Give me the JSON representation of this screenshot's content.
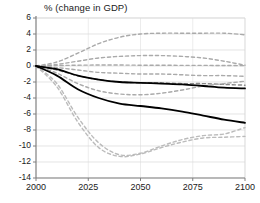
{
  "chart_data": {
    "type": "line",
    "title": "% (change in GDP)",
    "xlabel": "",
    "ylabel": "% (change in GDP)",
    "xlim": [
      2000,
      2100
    ],
    "ylim": [
      -14,
      6
    ],
    "grid": true,
    "legend": "none",
    "xticks": [
      2000,
      2025,
      2050,
      2075,
      2100
    ],
    "yticks": [
      6,
      4,
      2,
      0,
      -2,
      -4,
      -6,
      -8,
      -10,
      -12,
      -14
    ],
    "x": [
      2000,
      2010,
      2020,
      2030,
      2040,
      2050,
      2060,
      2070,
      2080,
      2090,
      2100
    ],
    "series": [
      {
        "name": "central-estimate-upper",
        "style": "solid",
        "color": "#000000",
        "width": 1.8,
        "values": [
          0.0,
          -0.4,
          -1.2,
          -1.7,
          -2.0,
          -2.1,
          -2.2,
          -2.3,
          -2.5,
          -2.7,
          -2.8
        ]
      },
      {
        "name": "central-estimate-lower",
        "style": "solid",
        "color": "#000000",
        "width": 1.8,
        "values": [
          0.0,
          -1.2,
          -2.9,
          -4.0,
          -4.7,
          -5.0,
          -5.3,
          -5.7,
          -6.2,
          -6.7,
          -7.1
        ]
      },
      {
        "name": "scenario-band-1",
        "style": "dashed",
        "color": "#aaaaaa",
        "width": 1.4,
        "values": [
          0.0,
          0.5,
          1.6,
          2.8,
          3.6,
          4.0,
          4.1,
          4.1,
          4.1,
          4.1,
          3.9
        ]
      },
      {
        "name": "scenario-band-2",
        "style": "dashed",
        "color": "#aaaaaa",
        "width": 1.4,
        "values": [
          0.0,
          0.2,
          0.6,
          1.0,
          1.2,
          1.3,
          1.3,
          1.2,
          1.0,
          0.6,
          0.1
        ]
      },
      {
        "name": "scenario-band-3",
        "style": "dashed",
        "color": "#aaaaaa",
        "width": 1.4,
        "values": [
          0.0,
          0.05,
          0.1,
          0.12,
          0.12,
          0.1,
          0.1,
          0.08,
          0.08,
          0.06,
          0.05
        ]
      },
      {
        "name": "scenario-band-4",
        "style": "dashed",
        "color": "#aaaaaa",
        "width": 1.4,
        "values": [
          0.0,
          -0.2,
          -0.5,
          -0.8,
          -0.9,
          -1.0,
          -1.0,
          -1.1,
          -1.2,
          -1.2,
          -1.3
        ]
      },
      {
        "name": "scenario-band-5",
        "style": "dashed",
        "color": "#888888",
        "width": 1.4,
        "values": [
          0.0,
          -0.5,
          -1.2,
          -1.7,
          -2.0,
          -2.1,
          -2.1,
          -2.2,
          -2.2,
          -2.3,
          -2.4
        ]
      },
      {
        "name": "scenario-band-6",
        "style": "dashed",
        "color": "#aaaaaa",
        "width": 1.4,
        "values": [
          0.0,
          -0.9,
          -2.2,
          -3.1,
          -3.5,
          -3.6,
          -3.4,
          -3.0,
          -2.5,
          -2.2,
          -1.9
        ]
      },
      {
        "name": "scenario-band-7",
        "style": "dashed",
        "color": "#bbbbbb",
        "width": 1.4,
        "values": [
          0.0,
          -2.2,
          -6.4,
          -9.6,
          -11.1,
          -10.9,
          -10.0,
          -9.2,
          -8.7,
          -8.5,
          -7.7
        ]
      },
      {
        "name": "scenario-band-8",
        "style": "dashed",
        "color": "#bbbbbb",
        "width": 1.4,
        "values": [
          0.0,
          -2.6,
          -7.0,
          -10.2,
          -11.3,
          -11.0,
          -10.2,
          -9.5,
          -9.0,
          -8.9,
          -8.8
        ]
      }
    ]
  },
  "axes": {
    "y_labels": [
      "6",
      "4",
      "2",
      "0",
      "-2",
      "-4",
      "-6",
      "-8",
      "-10",
      "-12",
      "-14"
    ],
    "x_labels": [
      "2000",
      "2025",
      "2050",
      "2075",
      "2100"
    ]
  },
  "colors": {
    "axis": "#808080",
    "grid": "#d8d8d8",
    "solid_line": "#000000",
    "dashed_line": "#aaaaaa",
    "text": "#1a1a1a",
    "background": "#ffffff"
  }
}
